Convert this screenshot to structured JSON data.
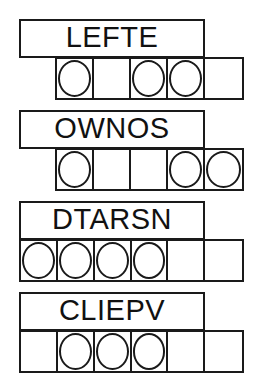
{
  "diagram": {
    "style": {
      "stroke_color": "#1a1a1a",
      "background_color": "#ffffff",
      "text_color": "#111111"
    },
    "groups": [
      {
        "id": "group-1",
        "word": "LEFTE",
        "word_box": {
          "x": 19,
          "y": 19,
          "width": 186,
          "height": 39
        },
        "cells_row": {
          "x": 55,
          "y": 57,
          "width": 189,
          "height": 43
        },
        "cell_count": 5,
        "cells": [
          {
            "index": 0,
            "marked": true
          },
          {
            "index": 1,
            "marked": false
          },
          {
            "index": 2,
            "marked": true
          },
          {
            "index": 3,
            "marked": true
          },
          {
            "index": 4,
            "marked": false
          }
        ]
      },
      {
        "id": "group-2",
        "word": "OWNOS",
        "word_box": {
          "x": 19,
          "y": 110,
          "width": 186,
          "height": 39
        },
        "cells_row": {
          "x": 55,
          "y": 148,
          "width": 189,
          "height": 43
        },
        "cell_count": 5,
        "cells": [
          {
            "index": 0,
            "marked": true
          },
          {
            "index": 1,
            "marked": false
          },
          {
            "index": 2,
            "marked": false
          },
          {
            "index": 3,
            "marked": true
          },
          {
            "index": 4,
            "marked": true
          }
        ]
      },
      {
        "id": "group-3",
        "word": "DTARSN",
        "word_box": {
          "x": 19,
          "y": 201,
          "width": 186,
          "height": 39
        },
        "cells_row": {
          "x": 19,
          "y": 239,
          "width": 225,
          "height": 43
        },
        "cell_count": 6,
        "cells": [
          {
            "index": 0,
            "marked": true
          },
          {
            "index": 1,
            "marked": true
          },
          {
            "index": 2,
            "marked": true
          },
          {
            "index": 3,
            "marked": true
          },
          {
            "index": 4,
            "marked": false
          },
          {
            "index": 5,
            "marked": false
          }
        ]
      },
      {
        "id": "group-4",
        "word": "CLIEPV",
        "word_box": {
          "x": 19,
          "y": 292,
          "width": 186,
          "height": 39
        },
        "cells_row": {
          "x": 19,
          "y": 330,
          "width": 225,
          "height": 43
        },
        "cell_count": 6,
        "cells": [
          {
            "index": 0,
            "marked": false
          },
          {
            "index": 1,
            "marked": true
          },
          {
            "index": 2,
            "marked": true
          },
          {
            "index": 3,
            "marked": true
          },
          {
            "index": 4,
            "marked": false
          },
          {
            "index": 5,
            "marked": false
          }
        ]
      }
    ]
  }
}
